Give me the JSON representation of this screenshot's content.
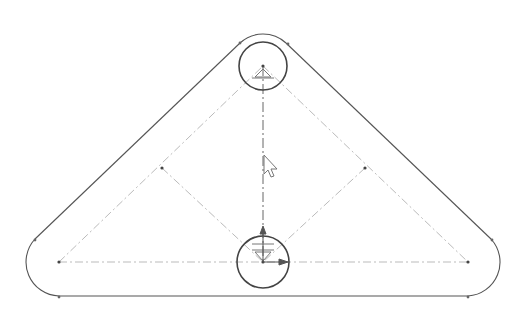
{
  "sketch": {
    "title": "Rounded triangular plate sketch",
    "colors": {
      "background": "#ffffff",
      "outline": "#555555",
      "construction": "#bbbbbb",
      "axis": "#666666",
      "point": "#444444"
    },
    "points": {
      "top_center": [
        263,
        66
      ],
      "bottom_center": [
        263,
        262
      ],
      "left_corner": [
        59,
        262
      ],
      "right_corner": [
        468,
        262
      ],
      "left_mid": [
        162,
        168
      ],
      "right_mid": [
        365,
        168
      ]
    },
    "holes": [
      {
        "name": "top-hole",
        "cx": 263,
        "cy": 66,
        "r": 24
      },
      {
        "name": "bottom-hole",
        "cx": 263,
        "cy": 262,
        "r": 26
      }
    ],
    "outer_radius": 34,
    "icons": [
      "cursor-arrow-icon",
      "origin-axis-icon",
      "fixed-constraint-icon"
    ]
  }
}
